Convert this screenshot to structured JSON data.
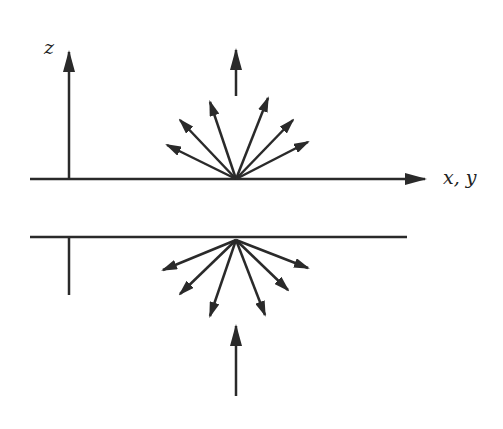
{
  "diagram": {
    "labels": {
      "z_axis": "z",
      "xy_axis": "x, y"
    },
    "colors": {
      "stroke": "#2a2a2a",
      "background": "#ffffff"
    },
    "upper_surface": {
      "y": 179,
      "x_start": 30,
      "x_end": 425
    },
    "lower_surface": {
      "y": 237,
      "x_start": 30,
      "x_end": 407
    },
    "upper_fan": {
      "origin": [
        236,
        179
      ],
      "tips": [
        [
          167,
          145
        ],
        [
          180,
          120
        ],
        [
          210,
          102
        ],
        [
          268,
          98
        ],
        [
          293,
          120
        ],
        [
          308,
          142
        ]
      ]
    },
    "lower_fan": {
      "origin": [
        236,
        240
      ],
      "tips": [
        [
          163,
          270
        ],
        [
          180,
          294
        ],
        [
          210,
          316
        ],
        [
          265,
          315
        ],
        [
          288,
          290
        ],
        [
          308,
          268
        ]
      ]
    },
    "incoming_arrow_top": {
      "from": [
        236,
        96
      ],
      "to": [
        236,
        50
      ]
    },
    "incoming_arrow_bottom": {
      "from": [
        236,
        396
      ],
      "to": [
        236,
        326
      ]
    }
  }
}
